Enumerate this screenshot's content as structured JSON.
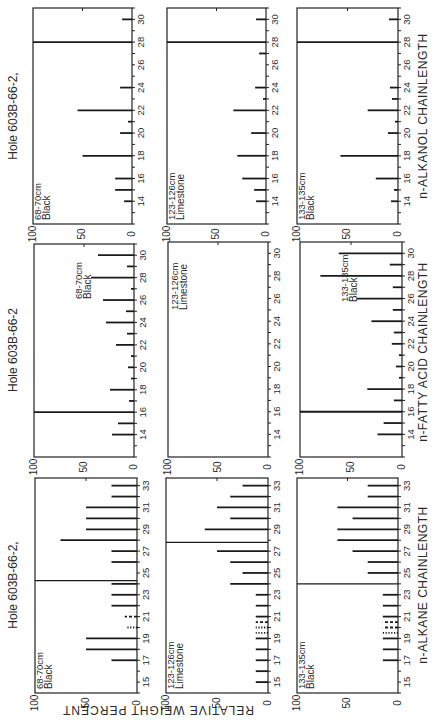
{
  "figure": {
    "value_axis_label": "RELATIVE WEIGHT PERCENT",
    "value_ticks": [
      "100",
      "50",
      "0"
    ],
    "orientation": "rotated-90-ccw"
  },
  "chart_data": [
    {
      "type": "bar",
      "group": "n-alkanol",
      "xlabel": "n-ALKANOL CHAINLENGTH",
      "ylabel": "RELATIVE WEIGHT PERCENT",
      "title": "Hole 603B-66-2,",
      "sample": "68-70cm",
      "lithology": "Black",
      "x_range": [
        12,
        31
      ],
      "tick_labels": [
        14,
        16,
        18,
        20,
        22,
        24,
        26,
        28,
        30
      ],
      "ylim": [
        0,
        100
      ],
      "bars": [
        {
          "x": 14,
          "v": 8
        },
        {
          "x": 15,
          "v": 17
        },
        {
          "x": 16,
          "v": 17
        },
        {
          "x": 18,
          "v": 50
        },
        {
          "x": 20,
          "v": 12
        },
        {
          "x": 21,
          "v": 4
        },
        {
          "x": 22,
          "v": 55
        },
        {
          "x": 24,
          "v": 12
        },
        {
          "x": 28,
          "v": 100
        },
        {
          "x": 30,
          "v": 10
        }
      ]
    },
    {
      "type": "bar",
      "group": "n-alkanol",
      "xlabel": "n-ALKANOL CHAINLENGTH",
      "ylabel": "RELATIVE WEIGHT PERCENT",
      "title": "",
      "sample": "123-126cm",
      "lithology": "Limestone",
      "x_range": [
        12,
        31
      ],
      "tick_labels": [
        14,
        16,
        18,
        20,
        22,
        24,
        26,
        28,
        30
      ],
      "ylim": [
        0,
        100
      ],
      "bars": [
        {
          "x": 14,
          "v": 10
        },
        {
          "x": 15,
          "v": 12
        },
        {
          "x": 16,
          "v": 24
        },
        {
          "x": 18,
          "v": 29
        },
        {
          "x": 20,
          "v": 15
        },
        {
          "x": 22,
          "v": 33
        },
        {
          "x": 23,
          "v": 3
        },
        {
          "x": 24,
          "v": 11
        },
        {
          "x": 27,
          "v": 7
        },
        {
          "x": 28,
          "v": 100
        },
        {
          "x": 30,
          "v": 10
        }
      ]
    },
    {
      "type": "bar",
      "group": "n-alkanol",
      "xlabel": "n-ALKANOL CHAINLENGTH",
      "ylabel": "RELATIVE WEIGHT PERCENT",
      "title": "",
      "sample": "133-135cm",
      "lithology": "Black",
      "x_range": [
        12,
        31
      ],
      "tick_labels": [
        14,
        16,
        18,
        20,
        22,
        24,
        26,
        28,
        30
      ],
      "ylim": [
        0,
        100
      ],
      "bars": [
        {
          "x": 14,
          "v": 7
        },
        {
          "x": 15,
          "v": 4
        },
        {
          "x": 16,
          "v": 22
        },
        {
          "x": 18,
          "v": 57
        },
        {
          "x": 20,
          "v": 10
        },
        {
          "x": 21,
          "v": 3
        },
        {
          "x": 22,
          "v": 30
        },
        {
          "x": 23,
          "v": 6
        },
        {
          "x": 24,
          "v": 8
        },
        {
          "x": 28,
          "v": 100
        },
        {
          "x": 30,
          "v": 9
        }
      ]
    },
    {
      "type": "bar",
      "group": "n-fatty-acid",
      "xlabel": "n-FATTY ACID CHAINLENGTH",
      "ylabel": "RELATIVE WEIGHT PERCENT",
      "title": "Hole 603B-66-2",
      "sample": "68-70cm",
      "lithology": "Black",
      "x_range": [
        12,
        31
      ],
      "tick_labels": [
        14,
        16,
        18,
        20,
        22,
        24,
        26,
        28,
        30
      ],
      "ylim": [
        0,
        100
      ],
      "bars": [
        {
          "x": 14,
          "v": 22
        },
        {
          "x": 15,
          "v": 16
        },
        {
          "x": 16,
          "v": 100
        },
        {
          "x": 17,
          "v": 5
        },
        {
          "x": 18,
          "v": 24
        },
        {
          "x": 19,
          "v": 3
        },
        {
          "x": 20,
          "v": 6
        },
        {
          "x": 21,
          "v": 3
        },
        {
          "x": 22,
          "v": 18
        },
        {
          "x": 23,
          "v": 7
        },
        {
          "x": 24,
          "v": 28
        },
        {
          "x": 25,
          "v": 8
        },
        {
          "x": 26,
          "v": 31
        },
        {
          "x": 27,
          "v": 3
        },
        {
          "x": 28,
          "v": 43
        },
        {
          "x": 29,
          "v": 7
        },
        {
          "x": 30,
          "v": 36
        }
      ]
    },
    {
      "type": "bar",
      "group": "n-fatty-acid",
      "xlabel": "n-FATTY ACID CHAINLENGTH",
      "ylabel": "RELATIVE WEIGHT PERCENT",
      "title": "",
      "sample": "123-126cm",
      "lithology": "Limestone",
      "x_range": [
        12,
        31
      ],
      "tick_labels": [
        14,
        16,
        18,
        20,
        22,
        24,
        26,
        28,
        30
      ],
      "ylim": [
        0,
        100
      ],
      "bars": []
    },
    {
      "type": "bar",
      "group": "n-fatty-acid",
      "xlabel": "n-FATTY ACID CHAINLENGTH",
      "ylabel": "RELATIVE WEIGHT PERCENT",
      "title": "",
      "sample": "133-135cm",
      "lithology": "Black",
      "x_range": [
        12,
        31
      ],
      "tick_labels": [
        14,
        16,
        18,
        20,
        22,
        24,
        26,
        28,
        30
      ],
      "ylim": [
        0,
        100
      ],
      "bars": [
        {
          "x": 14,
          "v": 24
        },
        {
          "x": 15,
          "v": 18
        },
        {
          "x": 16,
          "v": 100
        },
        {
          "x": 17,
          "v": 8
        },
        {
          "x": 18,
          "v": 34
        },
        {
          "x": 19,
          "v": 3
        },
        {
          "x": 20,
          "v": 6
        },
        {
          "x": 21,
          "v": 3
        },
        {
          "x": 22,
          "v": 10
        },
        {
          "x": 23,
          "v": 8
        },
        {
          "x": 24,
          "v": 30
        },
        {
          "x": 25,
          "v": 9
        },
        {
          "x": 26,
          "v": 44
        },
        {
          "x": 27,
          "v": 9
        },
        {
          "x": 28,
          "v": 80
        },
        {
          "x": 29,
          "v": 12
        },
        {
          "x": 30,
          "v": 62
        }
      ]
    },
    {
      "type": "bar",
      "group": "n-alkane",
      "xlabel": "n-ALKANE CHAINLENGTH",
      "ylabel": "RELATIVE WEIGHT PERCENT",
      "title": "Hole 603B-66-2,",
      "sample": "68-70cm",
      "lithology": "Black",
      "x_range": [
        14,
        33.7
      ],
      "tick_labels": [
        15,
        17,
        19,
        21,
        23,
        25,
        27,
        29,
        31,
        33
      ],
      "ylim": [
        0,
        100
      ],
      "bars": [
        {
          "x": 17,
          "v": 25
        },
        {
          "x": 18,
          "v": 50
        },
        {
          "x": 19,
          "v": 50
        },
        {
          "x": 20,
          "v": 10,
          "style": "dotted"
        },
        {
          "x": 21,
          "v": 12,
          "style": "dashed"
        },
        {
          "x": 22,
          "v": 25
        },
        {
          "x": 23,
          "v": 25
        },
        {
          "x": 24,
          "v": 25
        },
        {
          "x": 24.3,
          "v": 100,
          "ref": true
        },
        {
          "x": 26,
          "v": 25
        },
        {
          "x": 27,
          "v": 25
        },
        {
          "x": 28,
          "v": 75
        },
        {
          "x": 29,
          "v": 50
        },
        {
          "x": 30,
          "v": 50
        },
        {
          "x": 31,
          "v": 50
        },
        {
          "x": 32,
          "v": 25
        },
        {
          "x": 33,
          "v": 25
        }
      ]
    },
    {
      "type": "bar",
      "group": "n-alkane",
      "xlabel": "n-ALKANE CHAINLENGTH",
      "ylabel": "RELATIVE WEIGHT PERCENT",
      "title": "",
      "sample": "123-126cm",
      "lithology": "Limestone",
      "x_range": [
        14,
        33.7
      ],
      "tick_labels": [
        15,
        17,
        19,
        21,
        23,
        25,
        27,
        29,
        31,
        33
      ],
      "ylim": [
        0,
        100
      ],
      "bars": [
        {
          "x": 15,
          "v": 12
        },
        {
          "x": 16,
          "v": 12
        },
        {
          "x": 17,
          "v": 12
        },
        {
          "x": 18,
          "v": 12
        },
        {
          "x": 19,
          "v": 12
        },
        {
          "x": 19.5,
          "v": 12,
          "style": "dotted"
        },
        {
          "x": 20,
          "v": 12,
          "style": "dotted"
        },
        {
          "x": 20.5,
          "v": 12,
          "style": "dashed"
        },
        {
          "x": 21,
          "v": 12
        },
        {
          "x": 22,
          "v": 12
        },
        {
          "x": 23,
          "v": 12
        },
        {
          "x": 24,
          "v": 37
        },
        {
          "x": 25,
          "v": 25
        },
        {
          "x": 26,
          "v": 37
        },
        {
          "x": 27,
          "v": 50
        },
        {
          "x": 27.8,
          "v": 100,
          "ref": true
        },
        {
          "x": 29,
          "v": 62
        },
        {
          "x": 30,
          "v": 37
        },
        {
          "x": 31,
          "v": 50
        },
        {
          "x": 32,
          "v": 37
        },
        {
          "x": 33,
          "v": 25
        }
      ]
    },
    {
      "type": "bar",
      "group": "n-alkane",
      "xlabel": "n-ALKANE CHAINLENGTH",
      "ylabel": "RELATIVE WEIGHT PERCENT",
      "title": "",
      "sample": "133-135cm",
      "lithology": "Black",
      "x_range": [
        14,
        33.7
      ],
      "tick_labels": [
        15,
        17,
        19,
        21,
        23,
        25,
        27,
        29,
        31,
        33
      ],
      "ylim": [
        0,
        100
      ],
      "bars": [
        {
          "x": 17,
          "v": 15
        },
        {
          "x": 18,
          "v": 15
        },
        {
          "x": 19,
          "v": 15
        },
        {
          "x": 19.5,
          "v": 15,
          "style": "dotted"
        },
        {
          "x": 20,
          "v": 15,
          "style": "dashed"
        },
        {
          "x": 20.5,
          "v": 15,
          "style": "dashed"
        },
        {
          "x": 21,
          "v": 15
        },
        {
          "x": 22,
          "v": 15
        },
        {
          "x": 23,
          "v": 15
        },
        {
          "x": 24,
          "v": 100,
          "ref": true
        },
        {
          "x": 25,
          "v": 30
        },
        {
          "x": 26,
          "v": 30
        },
        {
          "x": 27,
          "v": 45
        },
        {
          "x": 28,
          "v": 60
        },
        {
          "x": 29,
          "v": 60
        },
        {
          "x": 30,
          "v": 45
        },
        {
          "x": 31,
          "v": 60
        },
        {
          "x": 32,
          "v": 30
        },
        {
          "x": 33,
          "v": 30
        }
      ]
    }
  ],
  "layout": {
    "panels": [
      {
        "left": 33,
        "top": 8,
        "right": 132,
        "bottom": 224,
        "title_x": 14,
        "title_y": 116
      },
      {
        "left": 167,
        "top": 8,
        "right": 266,
        "bottom": 224
      },
      {
        "left": 297,
        "top": 8,
        "right": 398,
        "bottom": 224,
        "xlabel_x": 424,
        "xlabel_y": 116
      },
      {
        "left": 34,
        "top": 244,
        "right": 134,
        "bottom": 457,
        "title_x": 14,
        "title_y": 350
      },
      {
        "left": 168,
        "top": 242,
        "right": 268,
        "bottom": 457
      },
      {
        "left": 300,
        "top": 242,
        "right": 402,
        "bottom": 457,
        "xlabel_x": 424,
        "xlabel_y": 352
      },
      {
        "left": 35,
        "top": 478,
        "right": 137,
        "bottom": 693,
        "title_x": 14,
        "title_y": 585
      },
      {
        "left": 166,
        "top": 478,
        "right": 268,
        "bottom": 693
      },
      {
        "left": 297,
        "top": 478,
        "right": 398,
        "bottom": 693,
        "xlabel_x": 424,
        "xlabel_y": 585
      }
    ],
    "ylabel_x": 158,
    "ylabel_y": 585
  }
}
